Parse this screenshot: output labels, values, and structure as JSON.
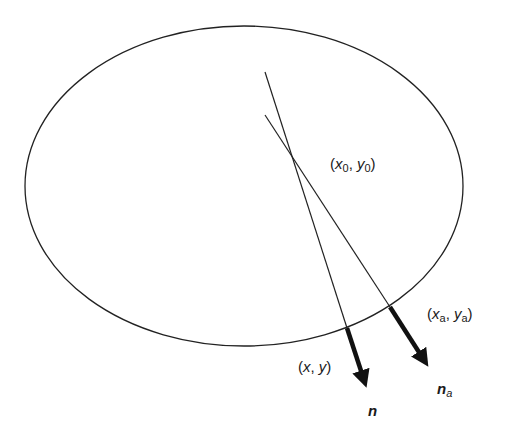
{
  "diagram": {
    "title": "",
    "shapes": {
      "ellipse": {
        "cx": 244,
        "cy": 186,
        "rx": 219,
        "ry": 160,
        "stroke": "#222222"
      }
    },
    "lines": [
      {
        "name": "normal-line-n",
        "from": [
          265,
          72
        ],
        "to": [
          347,
          328
        ]
      },
      {
        "name": "normal-line-na",
        "from": [
          265,
          115
        ],
        "to": [
          390,
          307
        ]
      }
    ],
    "arrows": [
      {
        "name": "normal-vector-n",
        "from": [
          347,
          328
        ],
        "to": [
          368,
          392
        ]
      },
      {
        "name": "normal-vector-na",
        "from": [
          390,
          307
        ],
        "to": [
          431,
          371
        ]
      }
    ],
    "labels": {
      "center_point": {
        "text": "(x0, y0)",
        "var_x": "x",
        "sub_x": "0",
        "var_y": "y",
        "sub_y": "0"
      },
      "actual_point": {
        "text": "(xa, ya)",
        "var_x": "x",
        "sub_x": "a",
        "var_y": "y",
        "sub_y": "a"
      },
      "surface_point": {
        "text": "(x, y)",
        "var_x": "x",
        "var_y": "y"
      },
      "normal_n": {
        "text": "n",
        "var": "n"
      },
      "normal_na": {
        "text": "na",
        "var": "n",
        "sub": "a"
      }
    },
    "punct": {
      "open": "(",
      "comma": ", ",
      "close": ")"
    }
  }
}
